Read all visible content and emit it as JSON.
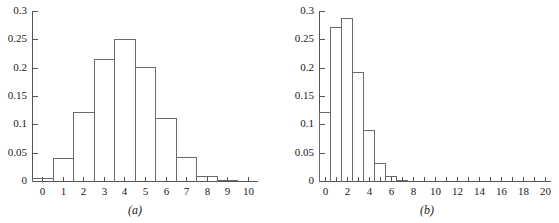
{
  "figure": {
    "panel_a_caption": "(a)",
    "panel_b_caption": "(b)"
  },
  "chart_data": [
    {
      "id": "panel-a",
      "type": "bar",
      "title": "",
      "caption": "(a)",
      "xlabel": "",
      "ylabel": "",
      "grid": false,
      "legend": "none",
      "categories": [
        "0",
        "1",
        "2",
        "3",
        "4",
        "5",
        "6",
        "7",
        "8",
        "9",
        "10"
      ],
      "values": [
        0.006,
        0.04,
        0.121,
        0.215,
        0.251,
        0.201,
        0.111,
        0.042,
        0.009,
        0.001,
        0.0
      ],
      "xlim": [
        -0.5,
        10.5
      ],
      "ylim": [
        0,
        0.3
      ],
      "x_ticks": [
        0,
        1,
        2,
        3,
        4,
        5,
        6,
        7,
        8,
        9,
        10
      ],
      "x_tick_labels": [
        "0",
        "1",
        "2",
        "3",
        "4",
        "5",
        "6",
        "7",
        "8",
        "9",
        "10"
      ],
      "y_ticks": [
        0,
        0.05,
        0.1,
        0.15,
        0.2,
        0.25,
        0.3
      ],
      "y_tick_labels": [
        "0",
        "0.05",
        "0.1",
        "0.15",
        "0.2",
        "0.25",
        "0.3"
      ]
    },
    {
      "id": "panel-b",
      "type": "bar",
      "title": "",
      "caption": "(b)",
      "xlabel": "",
      "ylabel": "",
      "grid": false,
      "legend": "none",
      "categories": [
        "0",
        "1",
        "2",
        "3",
        "4",
        "5",
        "6",
        "7",
        "8",
        "9",
        "10",
        "11",
        "12",
        "13",
        "14",
        "15",
        "16",
        "17",
        "18",
        "19",
        "20"
      ],
      "values": [
        0.122,
        0.271,
        0.287,
        0.192,
        0.09,
        0.032,
        0.008,
        0.002,
        0.0,
        0.0,
        0.0,
        0.0,
        0.0,
        0.0,
        0.0,
        0.0,
        0.0,
        0.0,
        0.0,
        0.0,
        0.0
      ],
      "xlim": [
        -0.5,
        20.5
      ],
      "ylim": [
        0,
        0.3
      ],
      "x_ticks": [
        0,
        1,
        2,
        3,
        4,
        5,
        6,
        7,
        8,
        9,
        10,
        11,
        12,
        13,
        14,
        15,
        16,
        17,
        18,
        19,
        20
      ],
      "x_tick_labels_shown": [
        "0",
        "2",
        "4",
        "6",
        "8",
        "10",
        "12",
        "14",
        "16",
        "18",
        "20"
      ],
      "x_tick_labels_shown_at": [
        0,
        2,
        4,
        6,
        8,
        10,
        12,
        14,
        16,
        18,
        20
      ],
      "y_ticks": [
        0,
        0.05,
        0.1,
        0.15,
        0.2,
        0.25,
        0.3
      ],
      "y_tick_labels": [
        "0",
        "0.05",
        "0.1",
        "0.15",
        "0.2",
        "0.25",
        "0.3"
      ]
    }
  ]
}
